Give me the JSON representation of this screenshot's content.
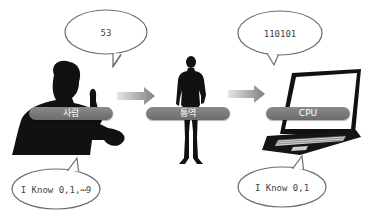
{
  "diagram": {
    "nodes": [
      {
        "id": "person",
        "label": "사람",
        "icon": "person-on-phone-silhouette"
      },
      {
        "id": "translator",
        "label": "통역",
        "icon": "standing-person-silhouette"
      },
      {
        "id": "cpu",
        "label": "CPU",
        "icon": "laptop-icon"
      }
    ],
    "edges": [
      {
        "from": "person",
        "to": "translator",
        "icon": "arrow-right-icon"
      },
      {
        "from": "translator",
        "to": "cpu",
        "icon": "arrow-right-icon"
      }
    ],
    "bubbles": {
      "person_top": "53",
      "cpu_top": "110101",
      "person_bottom": "I Know 0,1,⋯9",
      "cpu_bottom": "I Know 0,1"
    },
    "colors": {
      "silhouette": "#111111",
      "pill": "#7a7a7a",
      "bubble_stroke": "#6e6e6e",
      "arrow": "#8c8c8c"
    }
  }
}
